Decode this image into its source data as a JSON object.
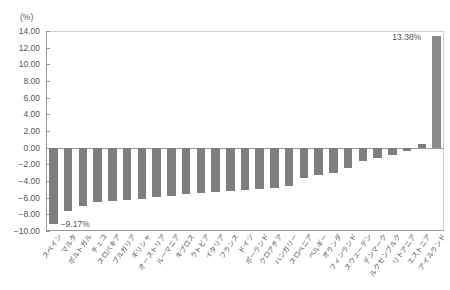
{
  "chart_data": {
    "type": "bar",
    "title": "",
    "subtitle": "",
    "xlabel": "",
    "ylabel": "",
    "unit_label": "(%)",
    "ylim": [
      -10.0,
      14.0
    ],
    "ytick_step": 2.0,
    "yticks": [
      "14.00",
      "12.00",
      "10.00",
      "8.00",
      "6.00",
      "4.00",
      "2.00",
      "0.00",
      "-2.00",
      "-4.00",
      "-6.00",
      "-8.00",
      "-10.00"
    ],
    "ytick_values": [
      14.0,
      12.0,
      10.0,
      8.0,
      6.0,
      4.0,
      2.0,
      0.0,
      -2.0,
      -4.0,
      -6.0,
      -8.0,
      -10.0
    ],
    "grid": false,
    "legend": "none",
    "bar_color": "#7e7e7e",
    "axis_color": "#9a9a9a",
    "categories": [
      "スペイン",
      "マルタ",
      "ポルトガル",
      "チェコ",
      "スロバキア",
      "ブルガリア",
      "ギリシャ",
      "オーストリア",
      "ルーマニア",
      "キプロス",
      "ラトビア",
      "イタリア",
      "フランス",
      "ドイツ",
      "ポーランド",
      "クロアチア",
      "ハンガリー",
      "スロベニア",
      "ベルギー",
      "オランダ",
      "フィンランド",
      "スウェーデン",
      "デンマーク",
      "ルクセンブルク",
      "リトアニア",
      "エストニア",
      "アイルランド"
    ],
    "values": [
      -9.17,
      -7.6,
      -7.05,
      -6.55,
      -6.4,
      -6.3,
      -6.2,
      -5.9,
      -5.75,
      -5.6,
      -5.5,
      -5.35,
      -5.2,
      -5.1,
      -4.95,
      -4.8,
      -4.6,
      -3.6,
      -3.3,
      -3.1,
      -2.4,
      -1.55,
      -1.25,
      -0.85,
      -0.45,
      0.4,
      13.38
    ],
    "annotations": [
      {
        "category": "スペイン",
        "text": "-9.17%"
      },
      {
        "category": "アイルランド",
        "text": "13.38%"
      }
    ]
  }
}
